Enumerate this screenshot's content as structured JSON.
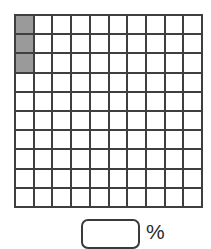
{
  "worksheet": {
    "name": "percent-hundred-grid-worksheet",
    "grid": {
      "rows": 10,
      "columns": 10,
      "total_cells": 100,
      "shaded_count": 3,
      "shaded_cells": [
        {
          "row": 1,
          "column": 1
        },
        {
          "row": 2,
          "column": 1
        },
        {
          "row": 3,
          "column": 1
        }
      ],
      "shaded_color": "#9a9a9a",
      "unshaded_color": "#ffffff",
      "line_color": "#3f3f3f"
    },
    "answer": {
      "value": "",
      "placeholder": "",
      "unit_label": "%"
    }
  },
  "chart_data": {
    "type": "heatmap",
    "title": "",
    "xlabel": "",
    "ylabel": "",
    "rows": 10,
    "columns": 10,
    "legend": [
      "shaded",
      "unshaded"
    ],
    "categories": [
      "shaded",
      "unshaded"
    ],
    "values": [
      3,
      97
    ],
    "cells": [
      [
        1,
        0,
        0,
        0,
        0,
        0,
        0,
        0,
        0,
        0
      ],
      [
        1,
        0,
        0,
        0,
        0,
        0,
        0,
        0,
        0,
        0
      ],
      [
        1,
        0,
        0,
        0,
        0,
        0,
        0,
        0,
        0,
        0
      ],
      [
        0,
        0,
        0,
        0,
        0,
        0,
        0,
        0,
        0,
        0
      ],
      [
        0,
        0,
        0,
        0,
        0,
        0,
        0,
        0,
        0,
        0
      ],
      [
        0,
        0,
        0,
        0,
        0,
        0,
        0,
        0,
        0,
        0
      ],
      [
        0,
        0,
        0,
        0,
        0,
        0,
        0,
        0,
        0,
        0
      ],
      [
        0,
        0,
        0,
        0,
        0,
        0,
        0,
        0,
        0,
        0
      ],
      [
        0,
        0,
        0,
        0,
        0,
        0,
        0,
        0,
        0,
        0
      ],
      [
        0,
        0,
        0,
        0,
        0,
        0,
        0,
        0,
        0,
        0
      ]
    ]
  }
}
